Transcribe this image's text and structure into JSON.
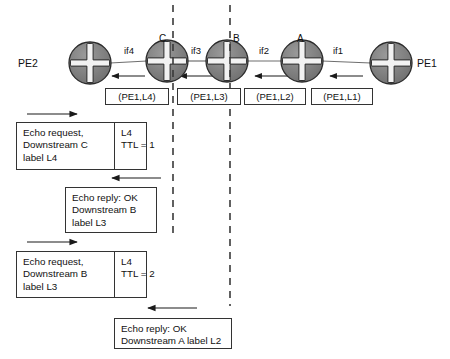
{
  "diagram": {
    "colors": {
      "router_fill": "#7a7a7a",
      "router_stroke": "#2b2b2b",
      "router_cross": "#f2f2f2",
      "line": "#6f6f6f",
      "arrow": "#1a1a1a",
      "dashed": "#3a3a3a",
      "box_border": "#333333",
      "text": "#111111",
      "background": "#ffffff"
    },
    "nodes": [
      {
        "id": "pe2",
        "label": "PE2",
        "tag": "",
        "cx": 90,
        "cy": 63,
        "r": 21,
        "label_x": 18,
        "label_y": 58
      },
      {
        "id": "c",
        "label": "",
        "tag": "C",
        "cx": 167,
        "cy": 61,
        "r": 21,
        "tag_x": 159,
        "tag_y": 34
      },
      {
        "id": "b",
        "label": "",
        "tag": "B",
        "cx": 227,
        "cy": 61,
        "r": 21,
        "tag_x": 233,
        "tag_y": 34
      },
      {
        "id": "a",
        "label": "",
        "tag": "A",
        "cx": 302,
        "cy": 61,
        "r": 21,
        "tag_x": 297,
        "tag_y": 34
      },
      {
        "id": "pe1",
        "label": "PE1",
        "tag": "",
        "cx": 391,
        "cy": 63,
        "r": 21,
        "label_x": 417,
        "label_y": 58
      }
    ],
    "interfaces": [
      {
        "name": "if4",
        "x": 124,
        "y": 46
      },
      {
        "name": "if3",
        "x": 191,
        "y": 46
      },
      {
        "name": "if2",
        "x": 259,
        "y": 46
      },
      {
        "name": "if1",
        "x": 333,
        "y": 46
      }
    ],
    "fec_labels": [
      {
        "text": "(PE1,L4)",
        "x": 105,
        "y": 88,
        "w": 64
      },
      {
        "text": "(PE1,L3)",
        "x": 177,
        "y": 88,
        "w": 64
      },
      {
        "text": "(PE1,L2)",
        "x": 244,
        "y": 88,
        "w": 62
      },
      {
        "text": "(PE1,L1)",
        "x": 311,
        "y": 88,
        "w": 62
      }
    ],
    "dashed_lines": [
      {
        "id": "dashed-c",
        "x": 173,
        "y1": 5,
        "y2": 234
      },
      {
        "id": "dashed-b",
        "x": 230,
        "y1": 5,
        "y2": 306
      }
    ],
    "link_arrows": [
      {
        "id": "link-arrow-if4",
        "x1": 145,
        "x2": 112,
        "y": 76
      },
      {
        "id": "link-arrow-if3",
        "x1": 213,
        "x2": 180,
        "y": 76
      },
      {
        "id": "link-arrow-if2",
        "x1": 288,
        "x2": 255,
        "y": 76
      },
      {
        "id": "link-arrow-if1",
        "x1": 363,
        "x2": 330,
        "y": 76
      }
    ],
    "flow_arrows": [
      {
        "id": "flow-arrow-request-1",
        "direction": "right",
        "x1": 27,
        "x2": 77,
        "y": 114
      },
      {
        "id": "flow-arrow-reply-1",
        "direction": "left",
        "x1": 161,
        "x2": 112,
        "y": 178
      },
      {
        "id": "flow-arrow-request-2",
        "direction": "right",
        "x1": 27,
        "x2": 77,
        "y": 242
      },
      {
        "id": "flow-arrow-reply-2",
        "direction": "left",
        "x1": 197,
        "x2": 148,
        "y": 308
      }
    ],
    "messages": [
      {
        "id": "echo-request-1",
        "x": 16,
        "y": 122,
        "w": 131,
        "h": 48,
        "left_w": 85,
        "left_lines": [
          "Echo request,",
          "Downstream C",
          "label L4"
        ],
        "right_lines": [
          "L4",
          "TTL = 1"
        ]
      },
      {
        "id": "echo-reply-1",
        "x": 65,
        "y": 187,
        "w": 92,
        "h": 46,
        "left_w": 0,
        "left_lines": [
          "Echo reply: OK",
          "Downstream B",
          "label L3"
        ],
        "right_lines": []
      },
      {
        "id": "echo-request-2",
        "x": 16,
        "y": 251,
        "w": 131,
        "h": 47,
        "left_w": 85,
        "left_lines": [
          "Echo request,",
          "Downstream B",
          "label L3"
        ],
        "right_lines": [
          "L4",
          "TTL = 2"
        ]
      },
      {
        "id": "echo-reply-2",
        "x": 114,
        "y": 318,
        "w": 118,
        "h": 31,
        "left_w": 0,
        "left_lines": [
          "Echo reply: OK",
          "Downstream A label L2"
        ],
        "right_lines": []
      }
    ]
  }
}
